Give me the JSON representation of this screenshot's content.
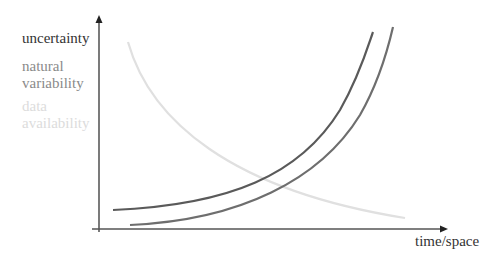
{
  "diagram": {
    "y_axis_label": "uncertainty",
    "x_axis_label": "time/space",
    "legend": [
      {
        "label_line1": "natural",
        "label_line2": "variability",
        "color": "#707070"
      },
      {
        "label_line1": "data",
        "label_line2": "availability",
        "color": "#dedede"
      }
    ],
    "curves": [
      {
        "name": "uncertainty",
        "color": "#5a5a5a",
        "shape": "rising-convex"
      },
      {
        "name": "natural variability",
        "color": "#707070",
        "shape": "rising-convex"
      },
      {
        "name": "data availability",
        "color": "#dedede",
        "shape": "falling-convex"
      }
    ],
    "axis_color": "#333333"
  }
}
